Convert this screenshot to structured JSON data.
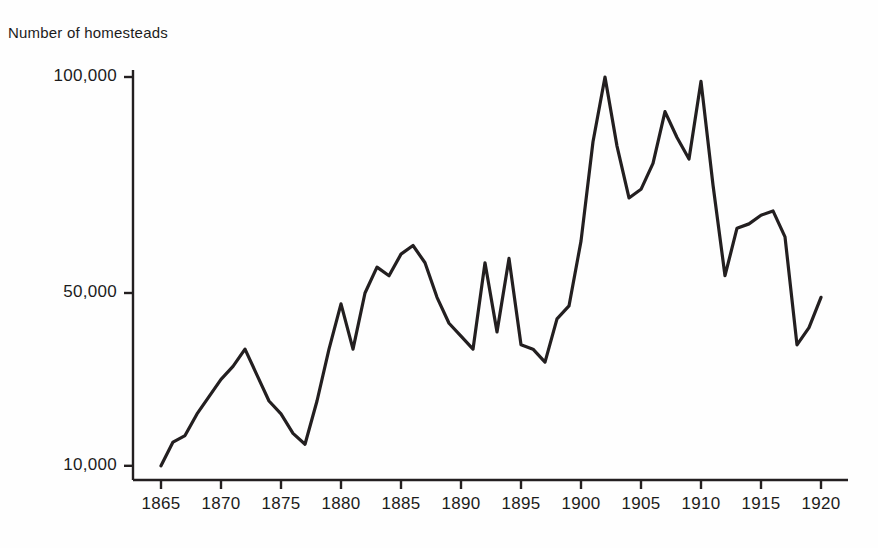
{
  "chart_data": {
    "type": "line",
    "title": "Number of homesteads",
    "xlabel": "",
    "ylabel": "Number of homesteads",
    "grid": false,
    "legend": null,
    "xlim": [
      1864,
      1921
    ],
    "ylim": [
      0,
      105000
    ],
    "y_ticks": [
      {
        "label": "100,000",
        "value": 100000
      },
      {
        "label": "50,000",
        "value": 50000
      },
      {
        "label": "10,000",
        "value": 10000
      }
    ],
    "x_ticks": [
      {
        "label": "1865",
        "value": 1865
      },
      {
        "label": "1870",
        "value": 1870
      },
      {
        "label": "1875",
        "value": 1875
      },
      {
        "label": "1880",
        "value": 1880
      },
      {
        "label": "1885",
        "value": 1885
      },
      {
        "label": "1890",
        "value": 1890
      },
      {
        "label": "1895",
        "value": 1895
      },
      {
        "label": "1900",
        "value": 1900
      },
      {
        "label": "1905",
        "value": 1905
      },
      {
        "label": "1910",
        "value": 1910
      },
      {
        "label": "1915",
        "value": 1915
      },
      {
        "label": "1920",
        "value": 1920
      }
    ],
    "x": [
      1865,
      1866,
      1867,
      1868,
      1869,
      1870,
      1871,
      1872,
      1873,
      1874,
      1875,
      1876,
      1877,
      1878,
      1879,
      1880,
      1881,
      1882,
      1883,
      1884,
      1885,
      1886,
      1887,
      1888,
      1889,
      1890,
      1891,
      1892,
      1893,
      1894,
      1895,
      1896,
      1897,
      1898,
      1899,
      1900,
      1901,
      1902,
      1903,
      1904,
      1905,
      1906,
      1907,
      1908,
      1909,
      1910,
      1911,
      1912,
      1913,
      1914,
      1915,
      1916,
      1917,
      1918,
      1919,
      1920
    ],
    "values": [
      10000,
      15500,
      17000,
      22000,
      26000,
      30000,
      33000,
      37000,
      31000,
      25000,
      22000,
      17500,
      15000,
      25000,
      37000,
      47500,
      37000,
      50000,
      56000,
      54000,
      59000,
      61000,
      57000,
      49000,
      43000,
      40000,
      37000,
      57000,
      41000,
      58000,
      38000,
      37000,
      34000,
      44000,
      47000,
      62000,
      85000,
      100000,
      84000,
      72000,
      74000,
      80000,
      92000,
      86000,
      81000,
      99000,
      75000,
      54000,
      65000,
      66000,
      68000,
      69000,
      63000,
      38000,
      42000,
      49000
    ],
    "line_color": "#231f20",
    "line_width": 3.2,
    "axis_color": "#231f20"
  },
  "geometry": {
    "plot_left": 133,
    "plot_bottom": 480,
    "plot_right": 848,
    "plot_top": 70,
    "x_origin_px": 161,
    "px_per_year": 12.0,
    "y50k_px": 293,
    "y100k_px": 77,
    "tick_len": 9
  }
}
